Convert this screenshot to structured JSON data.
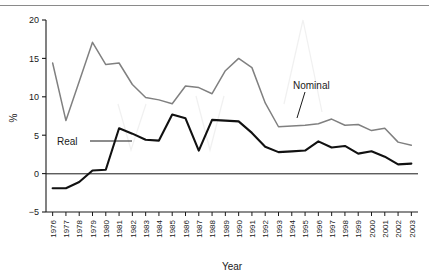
{
  "chart_data": {
    "type": "line",
    "title": "",
    "xlabel": "Year",
    "ylabel": "%",
    "ylim": [
      -5,
      20
    ],
    "yticks": [
      -5,
      0,
      5,
      10,
      15,
      20
    ],
    "ytick_labels": [
      "−5",
      "0",
      "5",
      "10",
      "15",
      "20"
    ],
    "grid": false,
    "legend": "inline-annotations",
    "categories": [
      "1976",
      "1977",
      "1978",
      "1979",
      "1980",
      "1981",
      "1982",
      "1983",
      "1984",
      "1985",
      "1986",
      "1987",
      "1988",
      "1989",
      "1990",
      "1991",
      "1992",
      "1993",
      "1994",
      "1995",
      "1996",
      "1997",
      "1998",
      "1999",
      "2000",
      "2001",
      "2002",
      "2003"
    ],
    "series": [
      {
        "name": "Nominal",
        "color": "#808080",
        "values": [
          14.4,
          6.9,
          12.0,
          17.1,
          14.2,
          14.4,
          11.6,
          9.9,
          9.6,
          9.1,
          11.4,
          11.2,
          10.4,
          13.4,
          15.0,
          13.8,
          9.2,
          6.1,
          6.2,
          6.3,
          6.5,
          7.1,
          6.3,
          6.4,
          5.6,
          5.9,
          4.1,
          3.7
        ]
      },
      {
        "name": "Real",
        "color": "#111111",
        "values": [
          -1.9,
          -1.9,
          -1.1,
          0.4,
          0.5,
          5.9,
          5.2,
          4.4,
          4.3,
          7.7,
          7.2,
          3.0,
          7.0,
          6.9,
          6.8,
          5.3,
          3.5,
          2.8,
          2.9,
          3.0,
          4.2,
          3.4,
          3.6,
          2.6,
          2.9,
          2.2,
          1.2,
          1.3
        ]
      }
    ],
    "annotations": [
      {
        "name": "Nominal",
        "text": "Nominal"
      },
      {
        "name": "Real",
        "text": "Real"
      }
    ]
  },
  "axes": {
    "x_axis_title": "Year",
    "y_axis_title": "%"
  }
}
